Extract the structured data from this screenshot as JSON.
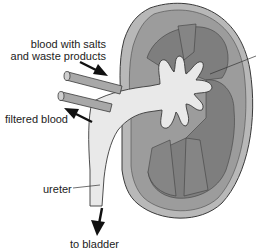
{
  "diagram": {
    "labels": {
      "blood_in_line1": "blood with salts",
      "blood_in_line2": "and waste products",
      "filtered_blood": "filtered blood",
      "ureter": "ureter",
      "to_bladder": "to bladder"
    },
    "colors": {
      "capsule_rim": "#b8b8b8",
      "cortex": "#9c9c9c",
      "medulla": "#7e7e7e",
      "pelvis": "#e9e9e9",
      "vessel": "#a8a8a8",
      "outline": "#3a3a3a",
      "arrow": "#111111"
    }
  }
}
